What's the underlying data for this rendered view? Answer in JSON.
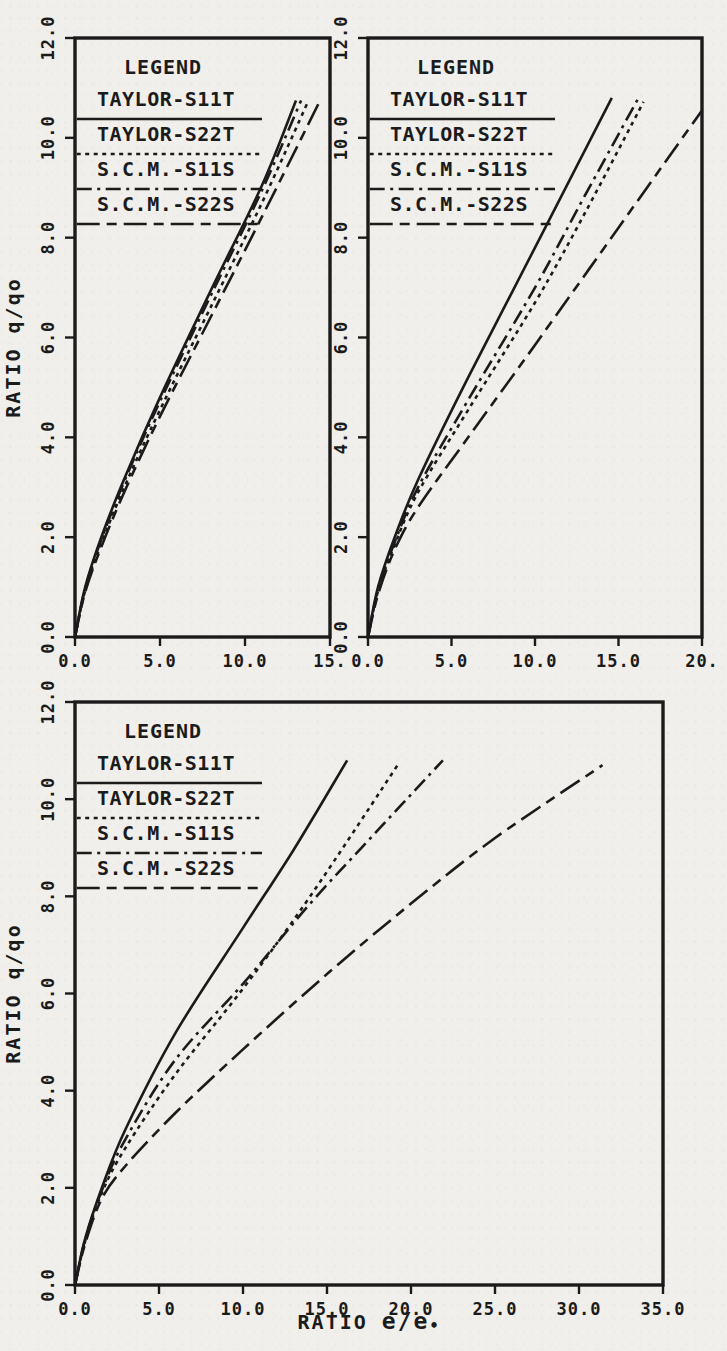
{
  "page": {
    "background_color": "#f1efeb",
    "ink_color": "#1b1b1b"
  },
  "legend": {
    "title": "LEGEND",
    "entries": [
      {
        "label": "TAYLOR-S11T",
        "style": "solid"
      },
      {
        "label": "TAYLOR-S22T",
        "style": "dotted"
      },
      {
        "label": "S.C.M.-S11S",
        "style": "dashdot"
      },
      {
        "label": "S.C.M.-S22S",
        "style": "longdash"
      }
    ]
  },
  "axis": {
    "ylabel": "RATIO q/qo",
    "yticks": [
      0,
      2,
      4,
      6,
      8,
      10,
      12
    ],
    "ytick_labels": [
      "0.0",
      "2.0",
      "4.0",
      "6.0",
      "8.0",
      "10.0",
      "12.0"
    ],
    "ylim": [
      0,
      12
    ]
  },
  "chart_data": [
    {
      "type": "line",
      "name": "chart-top-left",
      "title": "",
      "xlabel": "",
      "xlim": [
        0,
        15
      ],
      "ylim": [
        0,
        12
      ],
      "xticks": [
        0,
        5,
        10,
        15
      ],
      "xtick_labels": [
        "0.0",
        "5.0",
        "10.0",
        "15."
      ],
      "grid": false,
      "legend_position": "top-left-inside",
      "show_ylabel": true,
      "ylabel_center_value": 5.8,
      "px": {
        "left": 75,
        "top": 38,
        "right": 330,
        "bottom": 637
      },
      "series": [
        {
          "name": "TAYLOR-S11T",
          "style": "solid",
          "points": [
            [
              0,
              0
            ],
            [
              0.6,
              1.0
            ],
            [
              1.6,
              2.05
            ],
            [
              3,
              3.25
            ],
            [
              5,
              4.8
            ],
            [
              8,
              6.95
            ],
            [
              11,
              9.05
            ],
            [
              13.0,
              10.75
            ]
          ]
        },
        {
          "name": "S.C.M.-S11S",
          "style": "dashdot",
          "points": [
            [
              0,
              0
            ],
            [
              0.6,
              0.97
            ],
            [
              1.6,
              2.0
            ],
            [
              3,
              3.2
            ],
            [
              5,
              4.72
            ],
            [
              8,
              6.85
            ],
            [
              11,
              8.95
            ],
            [
              13.3,
              10.75
            ]
          ]
        },
        {
          "name": "TAYLOR-S22T",
          "style": "dotted",
          "points": [
            [
              0,
              0
            ],
            [
              0.6,
              0.93
            ],
            [
              1.6,
              1.92
            ],
            [
              3,
              3.08
            ],
            [
              5,
              4.55
            ],
            [
              8,
              6.62
            ],
            [
              11,
              8.7
            ],
            [
              13.7,
              10.72
            ]
          ]
        },
        {
          "name": "S.C.M.-S22S",
          "style": "longdash",
          "points": [
            [
              0,
              0
            ],
            [
              0.6,
              0.9
            ],
            [
              1.6,
              1.85
            ],
            [
              3,
              2.98
            ],
            [
              5,
              4.42
            ],
            [
              8,
              6.42
            ],
            [
              11,
              8.42
            ],
            [
              14.35,
              10.7
            ]
          ]
        }
      ]
    },
    {
      "type": "line",
      "name": "chart-top-right",
      "title": "",
      "xlabel": "",
      "xlim": [
        0,
        20
      ],
      "ylim": [
        0,
        12
      ],
      "xticks": [
        0,
        5,
        10,
        15,
        20
      ],
      "xtick_labels": [
        "0.0",
        "5.0",
        "10.0",
        "15.0",
        "20."
      ],
      "grid": false,
      "legend_position": "top-left-inside",
      "show_ylabel": false,
      "px": {
        "left": 368,
        "top": 38,
        "right": 702,
        "bottom": 637
      },
      "series": [
        {
          "name": "TAYLOR-S11T",
          "style": "solid",
          "points": [
            [
              0,
              0
            ],
            [
              0.6,
              1.0
            ],
            [
              1.6,
              2.0
            ],
            [
              3,
              3.15
            ],
            [
              6,
              5.2
            ],
            [
              10,
              7.8
            ],
            [
              14.6,
              10.8
            ]
          ]
        },
        {
          "name": "S.C.M.-S11S",
          "style": "dashdot",
          "points": [
            [
              0,
              0
            ],
            [
              0.6,
              0.95
            ],
            [
              1.6,
              1.9
            ],
            [
              3,
              3.0
            ],
            [
              6,
              4.75
            ],
            [
              10,
              7.0
            ],
            [
              13,
              8.85
            ],
            [
              16.2,
              10.8
            ]
          ]
        },
        {
          "name": "TAYLOR-S22T",
          "style": "dotted",
          "points": [
            [
              0,
              0
            ],
            [
              0.6,
              0.92
            ],
            [
              1.6,
              1.85
            ],
            [
              3,
              2.9
            ],
            [
              6,
              4.55
            ],
            [
              10,
              6.7
            ],
            [
              13,
              8.5
            ],
            [
              16.5,
              10.72
            ]
          ]
        },
        {
          "name": "S.C.M.-S22S",
          "style": "longdash",
          "points": [
            [
              0,
              0
            ],
            [
              0.6,
              0.85
            ],
            [
              1.6,
              1.75
            ],
            [
              3,
              2.6
            ],
            [
              6,
              4.0
            ],
            [
              10,
              5.85
            ],
            [
              15,
              8.2
            ],
            [
              20,
              10.55
            ]
          ]
        }
      ]
    },
    {
      "type": "line",
      "name": "chart-bottom",
      "title": "",
      "xlabel": "RATIO e/e•",
      "xlabel_parts": {
        "prefix": "RATIO ",
        "bold": "e/e",
        "subscript_dot": "•"
      },
      "xlim": [
        0,
        35
      ],
      "ylim": [
        0,
        12
      ],
      "xticks": [
        0,
        5,
        10,
        15,
        20,
        25,
        30,
        35
      ],
      "xtick_labels": [
        "0.0",
        "5.0",
        "10.0",
        "15.0",
        "20.0",
        "25.0",
        "30.0",
        "35.0"
      ],
      "grid": false,
      "legend_position": "top-left-inside",
      "show_ylabel": true,
      "ylabel_center_value": 6.0,
      "px": {
        "left": 75,
        "top": 702,
        "right": 663,
        "bottom": 1285
      },
      "series": [
        {
          "name": "TAYLOR-S11T",
          "style": "solid",
          "points": [
            [
              0,
              0
            ],
            [
              0.6,
              0.95
            ],
            [
              1.6,
              2.0
            ],
            [
              3,
              3.2
            ],
            [
              6,
              5.2
            ],
            [
              10,
              7.35
            ],
            [
              13,
              8.95
            ],
            [
              16.2,
              10.8
            ]
          ]
        },
        {
          "name": "TAYLOR-S22T",
          "style": "dotted",
          "points": [
            [
              0,
              0
            ],
            [
              0.6,
              0.9
            ],
            [
              1.6,
              1.9
            ],
            [
              3,
              2.82
            ],
            [
              6,
              4.35
            ],
            [
              10,
              6.1
            ],
            [
              14,
              8.0
            ],
            [
              19.3,
              10.75
            ]
          ]
        },
        {
          "name": "S.C.M.-S11S",
          "style": "dashdot",
          "points": [
            [
              0,
              0
            ],
            [
              0.6,
              0.93
            ],
            [
              1.6,
              1.95
            ],
            [
              3,
              3.0
            ],
            [
              6,
              4.65
            ],
            [
              10,
              6.2
            ],
            [
              14,
              7.85
            ],
            [
              18,
              9.35
            ],
            [
              21.9,
              10.8
            ]
          ]
        },
        {
          "name": "S.C.M.-S22S",
          "style": "longdash",
          "points": [
            [
              0,
              0
            ],
            [
              0.6,
              0.85
            ],
            [
              1.6,
              1.78
            ],
            [
              3,
              2.45
            ],
            [
              6,
              3.55
            ],
            [
              10,
              4.85
            ],
            [
              15,
              6.4
            ],
            [
              20,
              7.85
            ],
            [
              25,
              9.2
            ],
            [
              31.4,
              10.7
            ]
          ]
        }
      ]
    }
  ]
}
